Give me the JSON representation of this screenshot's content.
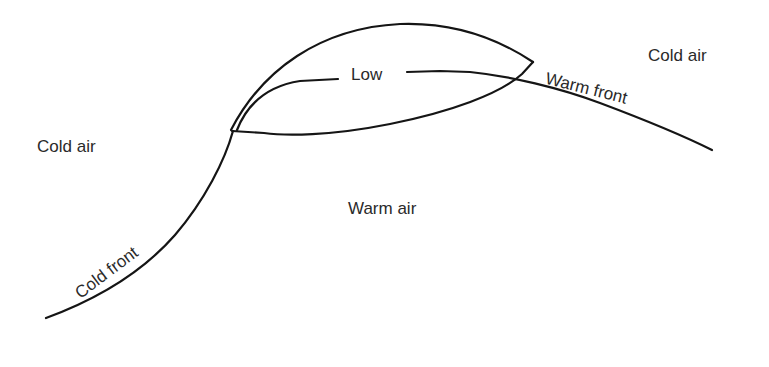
{
  "diagram": {
    "type": "weather-front-low-pressure-system",
    "labels": {
      "low": "Low",
      "cold_air_left": "Cold air",
      "cold_air_right": "Cold air",
      "warm_air": "Warm air",
      "warm_front": "Warm front",
      "cold_front": "Cold front"
    },
    "colors": {
      "line": "#151515",
      "text": "#2a2a2a",
      "background": "#ffffff"
    }
  }
}
